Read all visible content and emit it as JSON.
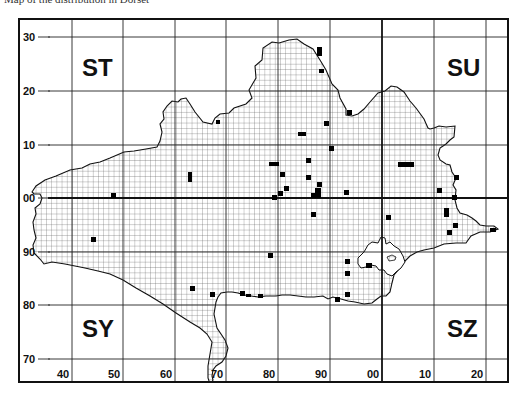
{
  "caption": "Map of the distribution in Dorset",
  "map": {
    "grid_squares": [
      {
        "label": "ST",
        "x": 82,
        "y": 76
      },
      {
        "label": "SU",
        "x": 447,
        "y": 76
      },
      {
        "label": "SY",
        "x": 82,
        "y": 337
      },
      {
        "label": "SZ",
        "x": 447,
        "y": 337
      }
    ],
    "y_axis_labels": [
      {
        "label": "30",
        "y": 37
      },
      {
        "label": "20",
        "y": 91
      },
      {
        "label": "10",
        "y": 145
      },
      {
        "label": "00",
        "y": 198
      },
      {
        "label": "90",
        "y": 252
      },
      {
        "label": "80",
        "y": 305
      },
      {
        "label": "70",
        "y": 359
      }
    ],
    "x_axis_labels": [
      {
        "label": "40",
        "x": 72
      },
      {
        "label": "50",
        "x": 123
      },
      {
        "label": "60",
        "x": 175
      },
      {
        "label": "70",
        "x": 226
      },
      {
        "label": "80",
        "x": 278
      },
      {
        "label": "90",
        "x": 330
      },
      {
        "label": "00",
        "x": 382
      },
      {
        "label": "10",
        "x": 434
      },
      {
        "label": "20",
        "x": 486
      }
    ],
    "records": [
      [
        317,
        47,
        5,
        9
      ],
      [
        319,
        69,
        5,
        4
      ],
      [
        324,
        121,
        5,
        5
      ],
      [
        347,
        110,
        5,
        5
      ],
      [
        306,
        158,
        5,
        5
      ],
      [
        329,
        146,
        5,
        5
      ],
      [
        269,
        162,
        10,
        4
      ],
      [
        306,
        175,
        5,
        5
      ],
      [
        317,
        182,
        5,
        5
      ],
      [
        284,
        186,
        5,
        5
      ],
      [
        278,
        191,
        5,
        5
      ],
      [
        272,
        195,
        5,
        5
      ],
      [
        315,
        188,
        6,
        10
      ],
      [
        311,
        193,
        6,
        5
      ],
      [
        311,
        212,
        5,
        5
      ],
      [
        298,
        132,
        8,
        4
      ],
      [
        280,
        172,
        5,
        5
      ],
      [
        398,
        162,
        16,
        5
      ],
      [
        452,
        195,
        5,
        5
      ],
      [
        437,
        188,
        5,
        5
      ],
      [
        454,
        175,
        5,
        5
      ],
      [
        444,
        208,
        5,
        9
      ],
      [
        447,
        230,
        5,
        5
      ],
      [
        453,
        223,
        5,
        5
      ],
      [
        490,
        228,
        6,
        4
      ],
      [
        386,
        215,
        5,
        5
      ],
      [
        344,
        190,
        5,
        5
      ],
      [
        188,
        172,
        4,
        10
      ],
      [
        111,
        193,
        5,
        5
      ],
      [
        91,
        237,
        5,
        5
      ],
      [
        268,
        253,
        5,
        5
      ],
      [
        345,
        259,
        5,
        5
      ],
      [
        345,
        271,
        5,
        5
      ],
      [
        345,
        292,
        5,
        5
      ],
      [
        335,
        297,
        5,
        5
      ],
      [
        190,
        286,
        5,
        5
      ],
      [
        210,
        292,
        5,
        5
      ],
      [
        240,
        291,
        5,
        5
      ],
      [
        246,
        294,
        5,
        3
      ],
      [
        258,
        294,
        5,
        4
      ],
      [
        366,
        263,
        6,
        5
      ],
      [
        216,
        120,
        4,
        4
      ]
    ],
    "colors": {
      "ink": "#111111",
      "fine_grid": "#555555",
      "background": "#ffffff"
    }
  }
}
